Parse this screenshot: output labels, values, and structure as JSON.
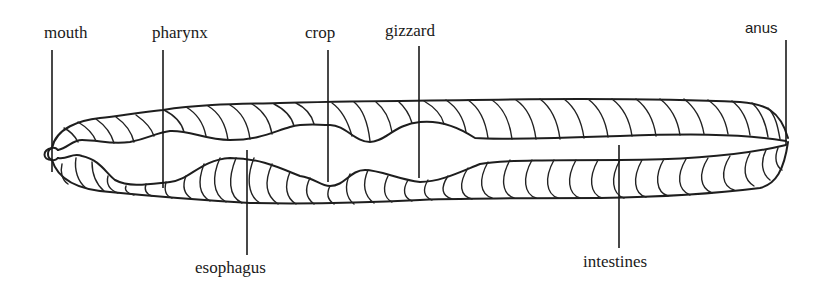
{
  "diagram": {
    "labels": [
      {
        "id": "mouth",
        "text": "mouth",
        "x": 44,
        "y": 24,
        "line_x": 52,
        "line_y1": 50,
        "line_y2": 172
      },
      {
        "id": "pharynx",
        "text": "pharynx",
        "x": 152,
        "y": 24,
        "line_x": 163,
        "line_y1": 50,
        "line_y2": 188
      },
      {
        "id": "crop",
        "text": "crop",
        "x": 305,
        "y": 24,
        "line_x": 328,
        "line_y1": 50,
        "line_y2": 182
      },
      {
        "id": "gizzard",
        "text": "gizzard",
        "x": 385,
        "y": 24,
        "line_x": 419,
        "line_y1": 46,
        "line_y2": 178
      },
      {
        "id": "anus",
        "text": "anus",
        "x": 787,
        "y": 20,
        "line_x": 786,
        "line_y1": 40,
        "line_y2": 145
      },
      {
        "id": "esophagus",
        "text": "esophagus",
        "x": 195,
        "y": 259,
        "line_x": 247,
        "line_y1": 150,
        "line_y2": 255
      },
      {
        "id": "intestines",
        "text": "intestines",
        "x": 583,
        "y": 255,
        "line_x": 619,
        "line_y1": 145,
        "line_y2": 248
      }
    ],
    "colors": {
      "background": "#ffffff",
      "ink": "#1e1e1e"
    }
  }
}
